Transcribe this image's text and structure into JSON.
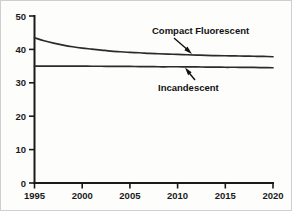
{
  "chart_data": {
    "type": "line",
    "title": "",
    "subtitle": "",
    "xlabel": "",
    "ylabel": "",
    "xlim": [
      1995,
      2020
    ],
    "ylim": [
      0,
      50
    ],
    "grid": false,
    "legend_position": "inline-annotations",
    "x_ticks": [
      1995,
      2000,
      2005,
      2010,
      2015,
      2020
    ],
    "x_tick_labels": [
      "1995",
      "2000",
      "2005",
      "2010",
      "2015",
      "2020"
    ],
    "y_ticks": [
      0,
      10,
      20,
      30,
      40,
      50
    ],
    "y_tick_labels": [
      "0",
      "10",
      "20",
      "30",
      "40",
      "50"
    ],
    "x": [
      1995,
      1996,
      1997,
      1998,
      1999,
      2000,
      2001,
      2002,
      2003,
      2004,
      2005,
      2006,
      2007,
      2008,
      2009,
      2010,
      2011,
      2012,
      2013,
      2014,
      2015,
      2016,
      2017,
      2018,
      2019,
      2020
    ],
    "series": [
      {
        "name": "Compact Fluorescent",
        "color": "#2b2b2b",
        "values": [
          43.5,
          42.6,
          41.9,
          41.3,
          40.8,
          40.4,
          40.1,
          39.8,
          39.5,
          39.3,
          39.1,
          39.0,
          38.8,
          38.7,
          38.6,
          38.5,
          38.4,
          38.3,
          38.2,
          38.15,
          38.1,
          38.05,
          38.0,
          37.95,
          37.9,
          37.8
        ]
      },
      {
        "name": "Incandescent",
        "color": "#2b2b2b",
        "values": [
          35.0,
          35.0,
          35.0,
          35.0,
          35.0,
          35.0,
          34.95,
          34.95,
          34.9,
          34.9,
          34.9,
          34.85,
          34.85,
          34.8,
          34.8,
          34.8,
          34.75,
          34.75,
          34.7,
          34.7,
          34.65,
          34.65,
          34.6,
          34.6,
          34.55,
          34.5
        ]
      }
    ],
    "annotations": [
      {
        "text": "Compact Fluorescent",
        "points_to_series": "Compact Fluorescent",
        "arrow_direction": "down-right"
      },
      {
        "text": "Incandescent",
        "points_to_series": "Incandescent",
        "arrow_direction": "up-left"
      }
    ]
  }
}
